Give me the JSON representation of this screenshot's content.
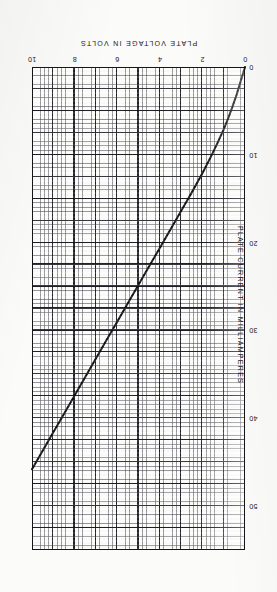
{
  "figure": {
    "orientation": "rotated-180",
    "page_background": "#fbfbfa",
    "grid_minor_color": "#46464e",
    "grid_major_color": "#18181e",
    "curve_color": "#111115",
    "border_color": "#15151a"
  },
  "chart_data": {
    "type": "line",
    "title": "",
    "xlabel": "PLATE VOLTAGE IN VOLTS",
    "ylabel": "PLATE CURRENT IN MILLIAMPERES",
    "xlim": [
      0,
      10
    ],
    "ylim": [
      0,
      55
    ],
    "xticks": [
      0,
      2,
      4,
      6,
      8,
      10
    ],
    "xtick_labels": [
      "0",
      "2",
      "4",
      "6",
      "8",
      "10"
    ],
    "yticks": [
      0,
      10,
      20,
      30,
      40,
      50
    ],
    "ytick_labels": [
      "0",
      "10",
      "20",
      "30",
      "40",
      "50"
    ],
    "grid": "major-and-minor",
    "legend": "none",
    "series": [
      {
        "name": "plate current",
        "x": [
          0.0,
          0.2,
          0.4,
          0.6,
          0.8,
          1.0,
          1.3,
          1.6,
          2.0,
          2.5,
          3.0,
          3.5,
          4.0,
          4.5,
          5.0,
          5.5,
          6.0,
          6.5,
          7.0,
          7.5,
          8.0,
          8.5,
          9.0,
          9.5,
          10.0
        ],
        "y": [
          0.0,
          1.6,
          3.2,
          4.6,
          5.9,
          7.1,
          8.7,
          10.2,
          12.1,
          14.3,
          16.4,
          18.5,
          20.6,
          22.7,
          24.8,
          26.9,
          29.0,
          31.1,
          33.2,
          35.3,
          37.4,
          39.5,
          41.6,
          43.7,
          45.8
        ]
      }
    ]
  }
}
